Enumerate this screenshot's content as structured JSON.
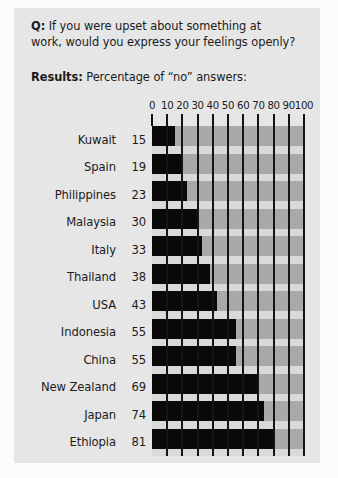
{
  "header": {
    "q_label": "Q:",
    "q_text_line1": "If you were upset about something at",
    "q_text_line2": "work, would you express your feelings openly?",
    "results_label": "Results:",
    "results_text": "Percentage of “no” answers:"
  },
  "colors": {
    "page_background": "#fcfcfc",
    "card_background": "#e6e6e6",
    "plot_background": "#a9a9a9",
    "row_gap": "#d9d9d9",
    "bar": "#090909",
    "gridline": "#141414",
    "text": "#1b1b1b"
  },
  "chart_data": {
    "type": "bar",
    "orientation": "horizontal",
    "title": "Percentage of “no” answers:",
    "question": "Q: If you were upset about something at work, would you express your feelings openly?",
    "xlabel": "",
    "ylabel": "",
    "xlim": [
      0,
      100
    ],
    "xticks": [
      0,
      10,
      20,
      30,
      40,
      50,
      60,
      70,
      80,
      90,
      100
    ],
    "xtick_labels": [
      "0",
      "10",
      "20",
      "30",
      "40",
      "50",
      "60",
      "70",
      "80",
      "90",
      "100"
    ],
    "grid": true,
    "legend": false,
    "categories": [
      "Kuwait",
      "Spain",
      "Philippines",
      "Malaysia",
      "Italy",
      "Thailand",
      "USA",
      "Indonesia",
      "China",
      "New Zealand",
      "Japan",
      "Ethiopia"
    ],
    "values": [
      15,
      19,
      23,
      30,
      33,
      38,
      43,
      55,
      55,
      69,
      74,
      81
    ],
    "rows": [
      {
        "label": "Kuwait",
        "value": 15
      },
      {
        "label": "Spain",
        "value": 19
      },
      {
        "label": "Philippines",
        "value": 23
      },
      {
        "label": "Malaysia",
        "value": 30
      },
      {
        "label": "Italy",
        "value": 33
      },
      {
        "label": "Thailand",
        "value": 38
      },
      {
        "label": "USA",
        "value": 43
      },
      {
        "label": "Indonesia",
        "value": 55
      },
      {
        "label": "China",
        "value": 55
      },
      {
        "label": "New Zealand",
        "value": 69
      },
      {
        "label": "Japan",
        "value": 74
      },
      {
        "label": "Ethiopia",
        "value": 81
      }
    ]
  }
}
